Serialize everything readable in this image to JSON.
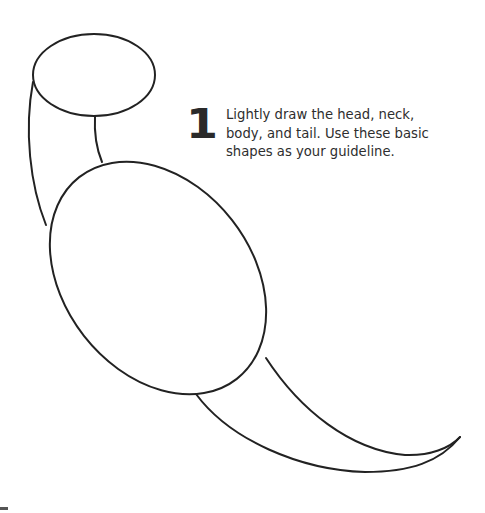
{
  "step": {
    "number": "1",
    "instruction": "Lightly draw the head, neck, body, and tail. Use these basic shapes as your guideline."
  },
  "drawing": {
    "subject": "bird guideline shapes",
    "parts": [
      "head",
      "neck",
      "body",
      "tail"
    ],
    "stroke_color": "#222222"
  }
}
